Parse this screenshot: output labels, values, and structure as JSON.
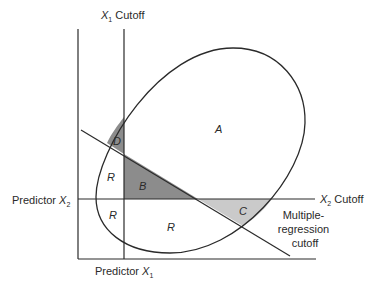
{
  "diagram": {
    "labels": {
      "x1_cutoff": {
        "var": "X",
        "sub": "1",
        "text": " Cutoff"
      },
      "x2_cutoff": {
        "var": "X",
        "sub": "2",
        "text": " Cutoff"
      },
      "predictor_x1": {
        "text": "Predictor ",
        "var": "X",
        "sub": "1"
      },
      "predictor_x2": {
        "text": "Predictor ",
        "var": "X",
        "sub": "2"
      },
      "multiple_regression": [
        "Multiple-",
        "regression",
        "cutoff"
      ]
    },
    "regions": {
      "A": "A",
      "B": "B",
      "C": "C",
      "D": "D",
      "R1": "R",
      "R2": "R",
      "R3": "R"
    },
    "colors": {
      "line": "#2a2a2a",
      "dark_shade": "#8c8c8c",
      "light_shade": "#cacaca",
      "background": "#ffffff"
    }
  }
}
